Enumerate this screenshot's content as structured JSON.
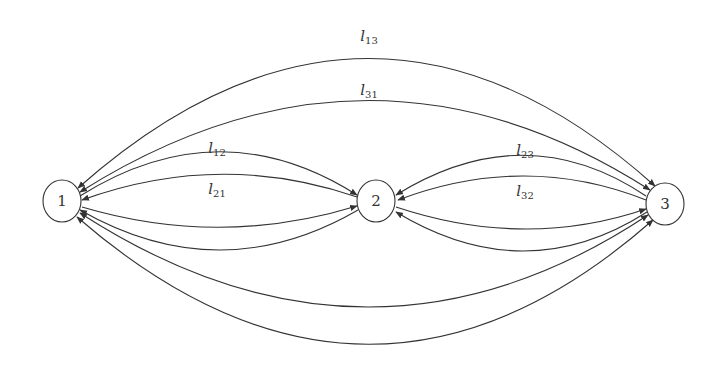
{
  "diagram": {
    "type": "directed-multigraph",
    "colors": {
      "stroke": "#333333",
      "background": "#ffffff"
    },
    "nodes": [
      {
        "id": "1",
        "label": "1",
        "x": 62,
        "y": 201
      },
      {
        "id": "2",
        "label": "2",
        "x": 376,
        "y": 201
      },
      {
        "id": "3",
        "label": "3",
        "x": 665,
        "y": 204
      }
    ],
    "edge_labels": [
      {
        "id": "l13",
        "base": "l",
        "sub": "13",
        "x": 369,
        "y": 36
      },
      {
        "id": "l31",
        "base": "l",
        "sub": "31",
        "x": 369,
        "y": 90
      },
      {
        "id": "l12",
        "base": "l",
        "sub": "12",
        "x": 217,
        "y": 148
      },
      {
        "id": "l21",
        "base": "l",
        "sub": "21",
        "x": 217,
        "y": 189
      },
      {
        "id": "l23",
        "base": "l",
        "sub": "23",
        "x": 525,
        "y": 150
      },
      {
        "id": "l32",
        "base": "l",
        "sub": "32",
        "x": 525,
        "y": 191
      }
    ],
    "edges": [
      {
        "name": "edge-l13",
        "from": "1",
        "to": "3",
        "d": "M 78 188 Q 369 -70 655 186",
        "arrow_end": true,
        "arrow_start": true
      },
      {
        "name": "edge-l31",
        "from": "3",
        "to": "1",
        "d": "M 80 192 Q 369 10 650 190",
        "arrow_end": true,
        "arrow_start": true
      },
      {
        "name": "edge-l12",
        "from": "1",
        "to": "2",
        "d": "M 80 196 Q 220 108 357 195",
        "arrow_end": true,
        "arrow_start": false
      },
      {
        "name": "edge-l21",
        "from": "2",
        "to": "1",
        "d": "M 357 197 Q 220 150 82 200",
        "arrow_end": true,
        "arrow_start": false
      },
      {
        "name": "edge-l23",
        "from": "3",
        "to": "2",
        "d": "M 646 196 Q 525 115 396 195",
        "arrow_end": true,
        "arrow_start": false
      },
      {
        "name": "edge-l32",
        "from": "3",
        "to": "2",
        "d": "M 646 200 Q 525 152 398 200",
        "arrow_end": true,
        "arrow_start": false
      },
      {
        "name": "edge-lower-1-2-a",
        "from": "1",
        "to": "2",
        "d": "M 82 207 Q 220 248 357 206",
        "arrow_end": true,
        "arrow_start": false
      },
      {
        "name": "edge-lower-1-2-b",
        "from": "2",
        "to": "1",
        "d": "M 358 210 Q 220 290 80 210",
        "arrow_end": true,
        "arrow_start": false
      },
      {
        "name": "edge-lower-2-3-a",
        "from": "2",
        "to": "3",
        "d": "M 396 207 Q 525 250 646 209",
        "arrow_end": true,
        "arrow_start": false
      },
      {
        "name": "edge-lower-2-3-b",
        "from": "3",
        "to": "2",
        "d": "M 647 212 Q 525 290 396 212",
        "arrow_end": true,
        "arrow_start": false
      },
      {
        "name": "edge-lower-1-3-a",
        "from": "1",
        "to": "3",
        "d": "M 80 213 Q 369 400 648 215",
        "arrow_end": true,
        "arrow_start": true
      },
      {
        "name": "edge-lower-1-3-b",
        "from": "3",
        "to": "1",
        "d": "M 77 217 Q 369 470 653 220",
        "arrow_end": true,
        "arrow_start": true
      }
    ]
  }
}
